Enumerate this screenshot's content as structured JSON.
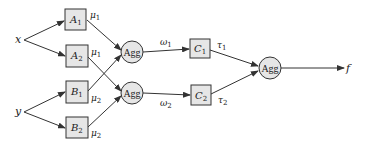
{
  "diagram": {
    "inputs": [
      {
        "id": "x",
        "label": "x"
      },
      {
        "id": "y",
        "label": "y"
      }
    ],
    "boxes": [
      {
        "id": "A1",
        "base": "A",
        "sub": "1",
        "out_base": "μ",
        "out_sub": "1"
      },
      {
        "id": "A2",
        "base": "A",
        "sub": "2",
        "out_base": "μ",
        "out_sub": "1"
      },
      {
        "id": "B1",
        "base": "B",
        "sub": "1",
        "out_base": "μ",
        "out_sub": "2"
      },
      {
        "id": "B2",
        "base": "B",
        "sub": "2",
        "out_base": "μ",
        "out_sub": "2"
      },
      {
        "id": "C1",
        "base": "C",
        "sub": "1",
        "out_base": "τ",
        "out_sub": "1"
      },
      {
        "id": "C2",
        "base": "C",
        "sub": "2",
        "out_base": "τ",
        "out_sub": "2"
      }
    ],
    "aggregators": [
      {
        "id": "agg1",
        "label": "Agg"
      },
      {
        "id": "agg2",
        "label": "Agg"
      },
      {
        "id": "agg3",
        "label": "Agg"
      }
    ],
    "weights": [
      {
        "id": "w1",
        "base": "ω",
        "sub": "1"
      },
      {
        "id": "w2",
        "base": "ω",
        "sub": "2"
      }
    ],
    "output": {
      "label": "f"
    },
    "edges": [
      [
        "x",
        "A1"
      ],
      [
        "x",
        "A2"
      ],
      [
        "y",
        "B1"
      ],
      [
        "y",
        "B2"
      ],
      [
        "A1",
        "agg1"
      ],
      [
        "B1",
        "agg1"
      ],
      [
        "A2",
        "agg2"
      ],
      [
        "B2",
        "agg2"
      ],
      [
        "agg1",
        "C1"
      ],
      [
        "agg2",
        "C2"
      ],
      [
        "C1",
        "agg3"
      ],
      [
        "C2",
        "agg3"
      ],
      [
        "agg3",
        "f"
      ]
    ],
    "colors": {
      "stroke": "#333333",
      "fill": "#e6e6e6"
    }
  }
}
